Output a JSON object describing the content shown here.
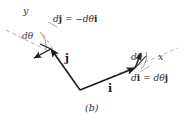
{
  "figure": {
    "caption": "(b)",
    "axes": {
      "y_label": "y",
      "x_label": "x"
    },
    "vectors": {
      "j_label": "j",
      "i_label": "i"
    },
    "angles": {
      "left_dtheta": "dθ",
      "right_dtheta": "dθ"
    },
    "equations": {
      "dj": {
        "lhs_d": "d",
        "lhs_vec": "j",
        "eq": " = −",
        "rhs_d": "dθ",
        "rhs_vec": "i",
        "full": "dj = −dθi"
      },
      "di": {
        "lhs_d": "d",
        "lhs_vec": "i",
        "eq": " = ",
        "rhs_d": "dθ",
        "rhs_vec": "j",
        "full": "di = dθj"
      }
    },
    "colors": {
      "vector_stroke": "#1a1a1a",
      "dashed_guide": "#a8a8a8",
      "arc_stroke": "#8c8c8c",
      "leader_line": "#9a9a9a",
      "background": "#ffffff",
      "text": "#2b2b2b"
    },
    "geometry": {
      "origin": [
        80,
        90
      ],
      "j_tip": [
        50,
        48
      ],
      "i_tip": [
        136,
        68
      ]
    }
  }
}
